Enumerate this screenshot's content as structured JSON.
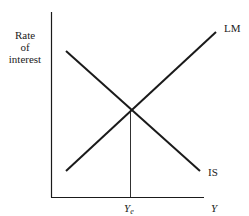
{
  "diagram": {
    "y_axis_label": [
      "Rate",
      "of",
      "interest"
    ],
    "x_axis_label": "Y",
    "curves": [
      {
        "name": "LM",
        "label": "LM",
        "slope": "upward"
      },
      {
        "name": "IS",
        "label": "IS",
        "slope": "downward"
      }
    ],
    "equilibrium_label_main": "Y",
    "equilibrium_label_sub": "e",
    "colors": {
      "line": "#1a1a1a",
      "text": "#222222",
      "background": "#ffffff"
    }
  }
}
